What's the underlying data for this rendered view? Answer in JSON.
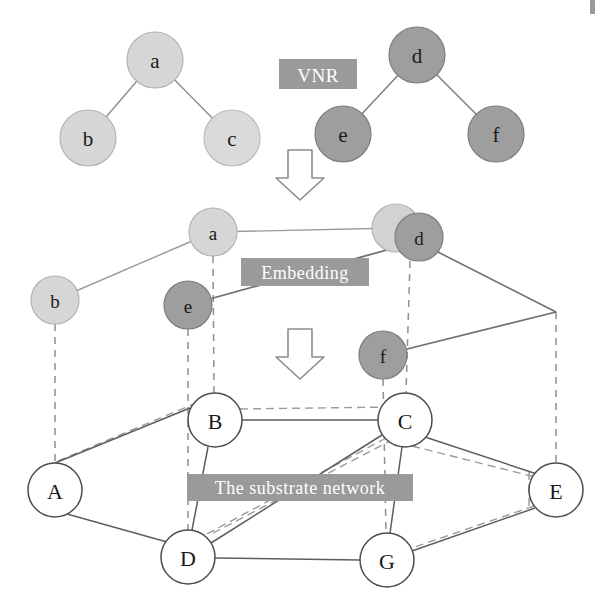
{
  "figure": {
    "background_color": "#ffffff",
    "width": 599,
    "height": 605
  },
  "palette": {
    "virtual_light_fill": "#d4d4d4",
    "virtual_light_stroke": "#b0b0b0",
    "virtual_dark_fill": "#9e9e9e",
    "virtual_dark_stroke": "#7d7d7d",
    "substrate_fill": "#ffffff",
    "substrate_stroke": "#4d4d4d",
    "edge_solid": "#6b6b6b",
    "edge_dashed": "#8a8a8a",
    "caption_box": "#9a9a9a",
    "caption_text": "#ffffff",
    "label_text": "#1a1a1a",
    "arrow_stroke": "#8c8c8c"
  },
  "captions": [
    {
      "id": "vnr",
      "label": "VNR",
      "x": 318,
      "y": 74,
      "box_w": 78,
      "box_h": 30,
      "font_size": 19
    },
    {
      "id": "embedding",
      "label": "Embedding",
      "x": 305,
      "y": 272,
      "box_w": 128,
      "box_h": 28,
      "font_size": 18
    },
    {
      "id": "substrate",
      "label": "The substrate network",
      "x": 300,
      "y": 487,
      "box_w": 226,
      "box_h": 27,
      "font_size": 18
    }
  ],
  "arrows": [
    {
      "id": "vnr-to-embedding",
      "x": 300,
      "y": 148,
      "width": 38,
      "height": 50
    },
    {
      "id": "embedding-to-substrate",
      "x": 300,
      "y": 327,
      "width": 38,
      "height": 50
    }
  ],
  "vnr_layer": {
    "name": "Virtual Network Requests",
    "nodes": [
      {
        "id": "a",
        "label": "a",
        "x": 155,
        "y": 60,
        "r": 28,
        "kind": "light"
      },
      {
        "id": "b",
        "label": "b",
        "x": 88,
        "y": 138,
        "r": 28,
        "kind": "light"
      },
      {
        "id": "c",
        "label": "c",
        "x": 232,
        "y": 138,
        "r": 28,
        "kind": "light"
      },
      {
        "id": "d",
        "label": "d",
        "x": 417,
        "y": 55,
        "r": 28,
        "kind": "dark"
      },
      {
        "id": "e",
        "label": "e",
        "x": 343,
        "y": 134,
        "r": 28,
        "kind": "dark"
      },
      {
        "id": "f",
        "label": "f",
        "x": 496,
        "y": 134,
        "r": 28,
        "kind": "dark"
      }
    ],
    "edges": [
      {
        "from": "a",
        "to": "b",
        "style": "solid"
      },
      {
        "from": "a",
        "to": "c",
        "style": "solid"
      },
      {
        "from": "d",
        "to": "e",
        "style": "solid"
      },
      {
        "from": "d",
        "to": "f",
        "style": "solid"
      }
    ]
  },
  "embedding_layer": {
    "name": "Embedded virtual nodes",
    "nodes": [
      {
        "id": "a2",
        "label": "a",
        "x": 213,
        "y": 232,
        "r": 24,
        "kind": "light"
      },
      {
        "id": "b2",
        "label": "b",
        "x": 55,
        "y": 300,
        "r": 24,
        "kind": "light"
      },
      {
        "id": "c2",
        "label": "",
        "x": 396,
        "y": 228,
        "r": 24,
        "kind": "light"
      },
      {
        "id": "d2",
        "label": "d",
        "x": 419,
        "y": 237,
        "r": 24,
        "kind": "dark"
      },
      {
        "id": "e2",
        "label": "e",
        "x": 188,
        "y": 305,
        "r": 24,
        "kind": "dark"
      },
      {
        "id": "f2",
        "label": "f",
        "x": 383,
        "y": 355,
        "r": 24,
        "kind": "dark"
      }
    ],
    "edges": [
      {
        "from": "b2",
        "to": "a2",
        "style": "solid"
      },
      {
        "from": "a2",
        "to": "c2",
        "style": "solid"
      },
      {
        "from": "d2",
        "to": "e2",
        "style": "solid"
      },
      {
        "from": "d2",
        "to": "corner",
        "style": "solid"
      },
      {
        "from": "corner",
        "to": "f2",
        "style": "solid"
      }
    ],
    "corner_point": {
      "x": 556,
      "y": 312
    },
    "mapping_links": [
      {
        "from": "b2",
        "to": "A",
        "style": "dashed"
      },
      {
        "from": "a2",
        "to": "B",
        "style": "dashed"
      },
      {
        "from": "e2",
        "to": "D",
        "style": "dashed"
      },
      {
        "from": "d2",
        "to": "C",
        "style": "dashed"
      },
      {
        "from": "f2",
        "to": "G",
        "style": "dashed"
      },
      {
        "from": "corner",
        "to": "E",
        "style": "dashed"
      }
    ]
  },
  "substrate_layer": {
    "name": "The substrate network",
    "nodes": [
      {
        "id": "A",
        "label": "A",
        "x": 55,
        "y": 490,
        "r": 27
      },
      {
        "id": "B",
        "label": "B",
        "x": 215,
        "y": 420,
        "r": 27
      },
      {
        "id": "C",
        "label": "C",
        "x": 405,
        "y": 420,
        "r": 27
      },
      {
        "id": "D",
        "label": "D",
        "x": 188,
        "y": 557,
        "r": 27
      },
      {
        "id": "E",
        "label": "E",
        "x": 556,
        "y": 490,
        "r": 27
      },
      {
        "id": "G",
        "label": "G",
        "x": 387,
        "y": 560,
        "r": 27
      }
    ],
    "edges": [
      {
        "from": "A",
        "to": "B",
        "style": "solid"
      },
      {
        "from": "A",
        "to": "D",
        "style": "solid"
      },
      {
        "from": "B",
        "to": "C",
        "style": "solid"
      },
      {
        "from": "B",
        "to": "D",
        "style": "solid"
      },
      {
        "from": "C",
        "to": "D",
        "style": "solid"
      },
      {
        "from": "C",
        "to": "E",
        "style": "solid"
      },
      {
        "from": "C",
        "to": "G",
        "style": "solid"
      },
      {
        "from": "D",
        "to": "G",
        "style": "solid"
      },
      {
        "from": "E",
        "to": "G",
        "style": "solid"
      }
    ],
    "virtual_paths": [
      {
        "id": "path-A-B",
        "from": "A",
        "to": "B",
        "style": "dashed"
      },
      {
        "id": "path-B-C",
        "from": "B",
        "to": "C",
        "style": "dashed"
      },
      {
        "id": "path-C-D",
        "from": "C",
        "to": "D",
        "style": "dashed"
      },
      {
        "id": "path-C-E",
        "from": "C",
        "to": "E",
        "style": "dashed"
      },
      {
        "id": "path-E-G",
        "from": "E",
        "to": "G",
        "style": "dashed"
      },
      {
        "id": "path-D-C-alt",
        "from": "D",
        "to": "C",
        "style": "dashed"
      }
    ]
  }
}
